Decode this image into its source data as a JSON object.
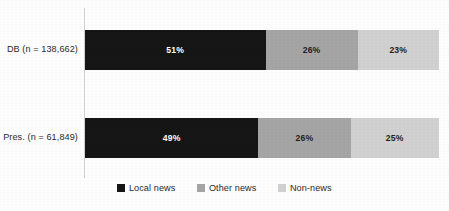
{
  "chart_data": {
    "type": "bar",
    "orientation": "horizontal",
    "stacked": true,
    "normalized_percent": true,
    "title": "",
    "subtitle": "",
    "xlabel": "",
    "ylabel": "",
    "xlim": [
      0,
      100
    ],
    "grid": false,
    "legend_position": "bottom-center",
    "categories": [
      "DB (n = 138,662)",
      "Pres. (n = 61,849)"
    ],
    "series": [
      {
        "name": "Local news",
        "color": "#161616",
        "values": [
          51,
          49
        ],
        "labels": [
          "51%",
          "49%"
        ],
        "label_color": "#ffffff"
      },
      {
        "name": "Other news",
        "color": "#a6a6a6",
        "values": [
          26,
          26
        ],
        "labels": [
          "26%",
          "26%"
        ],
        "label_color": "#1f1f1f"
      },
      {
        "name": "Non-news",
        "color": "#d2d2d2",
        "values": [
          23,
          25
        ],
        "labels": [
          "23%",
          "25%"
        ],
        "label_color": "#1f1f1f"
      }
    ],
    "axis_line_color": "#d4d4d4",
    "background_color": "#ffffff"
  },
  "axis": {
    "categories": [
      {
        "label": "DB (n = 138,662)"
      },
      {
        "label": "Pres. (n = 61,849)"
      }
    ]
  },
  "bars": [
    {
      "category": "DB (n = 138,662)",
      "segments": [
        {
          "series": "Local news",
          "value": 51,
          "label": "51%"
        },
        {
          "series": "Other news",
          "value": 26,
          "label": "26%"
        },
        {
          "series": "Non-news",
          "value": 23,
          "label": "23%"
        }
      ]
    },
    {
      "category": "Pres. (n = 61,849)",
      "segments": [
        {
          "series": "Local news",
          "value": 49,
          "label": "49%"
        },
        {
          "series": "Other news",
          "value": 26,
          "label": "26%"
        },
        {
          "series": "Non-news",
          "value": 25,
          "label": "25%"
        }
      ]
    }
  ],
  "legend": {
    "items": [
      {
        "label": "Local news",
        "color": "#161616"
      },
      {
        "label": "Other news",
        "color": "#a6a6a6"
      },
      {
        "label": "Non-news",
        "color": "#d2d2d2"
      }
    ]
  }
}
